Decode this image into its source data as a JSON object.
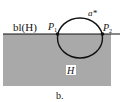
{
  "diagram": {
    "boundary_label": "bl(H)",
    "region_label": "H",
    "curve_label": "a*",
    "points": [
      {
        "name": "P",
        "subscript": "1"
      },
      {
        "name": "P",
        "subscript": "2"
      }
    ],
    "caption": "b.",
    "colors": {
      "region_fill": "#a9a9a9",
      "line": "#111111",
      "background": "#ffffff"
    }
  }
}
